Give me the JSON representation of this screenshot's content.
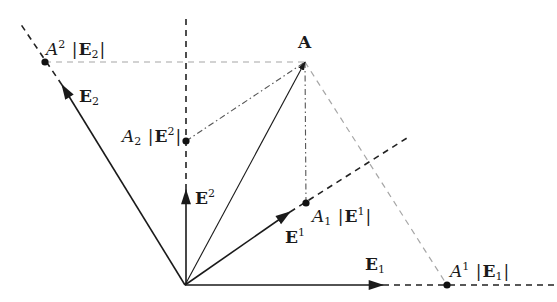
{
  "diagram": {
    "colors": {
      "solid": "#1a1a1a",
      "dashed_dark": "#222222",
      "dashed_light": "#a6a6a6",
      "dashdot": "#555555",
      "background": "#ffffff"
    },
    "origin": {
      "x": 185,
      "y": 285
    },
    "vectors": [
      {
        "name": "A",
        "label": "A",
        "tip": {
          "x": 305,
          "y": 62
        }
      },
      {
        "name": "E_2",
        "label": "E",
        "sub": "2",
        "tip": {
          "x": 62,
          "y": 85
        }
      },
      {
        "name": "E^2",
        "label": "E",
        "sup": "2",
        "tip": {
          "x": 186,
          "y": 190
        }
      },
      {
        "name": "E^1",
        "label": "E",
        "sup": "1",
        "tip": {
          "x": 290,
          "y": 212
        }
      },
      {
        "name": "E_1",
        "label": "E",
        "sub": "1",
        "tip": {
          "x": 383,
          "y": 285
        }
      }
    ],
    "points": [
      {
        "name": "A2_E_2",
        "coef": "A",
        "coef_sup": "2",
        "vec": "E",
        "vec_sub": "2",
        "x": 45,
        "y": 62
      },
      {
        "name": "A_2_E2",
        "coef": "A",
        "coef_sub": "2",
        "vec": "E",
        "vec_sup": "2",
        "x": 186,
        "y": 141
      },
      {
        "name": "A_1_E1",
        "coef": "A",
        "coef_sub": "1",
        "vec": "E",
        "vec_sup": "1",
        "x": 306,
        "y": 203
      },
      {
        "name": "A1_E_1",
        "coef": "A",
        "coef_sup": "1",
        "vec": "E",
        "vec_sub": "1",
        "x": 447,
        "y": 285
      }
    ],
    "labels": {
      "A": "A",
      "E": "E",
      "one": "1",
      "two": "2",
      "bar": "|"
    }
  }
}
